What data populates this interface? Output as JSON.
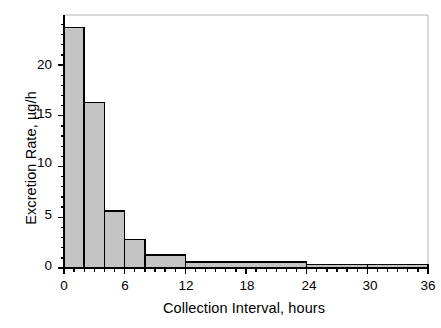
{
  "chart_data": {
    "type": "bar",
    "title": "",
    "subtitle": "",
    "xlabel": "Collection Interval, hours",
    "ylabel": "Excretion Rate, µg/h",
    "xlim": [
      0,
      36
    ],
    "ylim": [
      0,
      24.6
    ],
    "grid": false,
    "legend": null,
    "xticks": [
      0,
      6,
      12,
      18,
      24,
      30,
      36
    ],
    "xtick_labels": [
      "0",
      "6",
      "12",
      "18",
      "24",
      "30",
      "36"
    ],
    "xminor_tick_step": 1,
    "yticks": [
      0,
      5,
      10,
      15,
      20
    ],
    "ytick_labels": [
      "0",
      "5",
      "10",
      "15",
      "20"
    ],
    "yminor_tick_step": 1,
    "bin_edges": [
      0,
      2,
      4,
      6,
      8,
      12,
      24,
      30,
      36
    ],
    "categories": [
      "0–2",
      "2–4",
      "4–6",
      "6–8",
      "8–12",
      "12–24",
      "24–30",
      "30–36"
    ],
    "values": [
      23.7,
      16.3,
      5.6,
      2.8,
      1.3,
      0.6,
      0.35,
      0.35
    ],
    "bar_fill_color": "#c4c4c4",
    "bar_edge_color": "#000000",
    "axis_color": "#000000",
    "frame_color": "#b4b4b4",
    "background_color": "#ffffff"
  },
  "axes": {
    "x_title": "Collection Interval, hours",
    "y_title": "Excretion Rate, µg/h"
  },
  "ticks": {
    "y": [
      {
        "label": "20",
        "top": 58
      },
      {
        "label": "15",
        "top": 107
      },
      {
        "label": "10",
        "top": 156
      },
      {
        "label": "5",
        "top": 208
      },
      {
        "label": "0",
        "top": 259
      }
    ],
    "x": [
      {
        "label": "0",
        "left": 49
      },
      {
        "label": "6",
        "left": 110
      },
      {
        "label": "12",
        "left": 171
      },
      {
        "label": "18",
        "left": 232
      },
      {
        "label": "24",
        "left": 294
      },
      {
        "label": "30",
        "left": 355
      },
      {
        "label": "36",
        "left": 413
      }
    ]
  }
}
